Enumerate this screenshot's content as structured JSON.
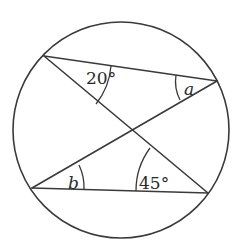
{
  "diagram": {
    "type": "circle-geometry",
    "circle": {
      "cx": 121,
      "cy": 130,
      "r": 108
    },
    "points": {
      "A": {
        "x": 44,
        "y": 56
      },
      "B": {
        "x": 217,
        "y": 81
      },
      "C": {
        "x": 32,
        "y": 188
      },
      "D": {
        "x": 208,
        "y": 193
      }
    },
    "chords": [
      {
        "from": "A",
        "to": "B"
      },
      {
        "from": "A",
        "to": "D"
      },
      {
        "from": "C",
        "to": "B"
      },
      {
        "from": "C",
        "to": "D"
      }
    ],
    "angles": [
      {
        "id": "angle-20",
        "vertex": "A",
        "label": "20°",
        "italic": false,
        "arc": "M 111 66 A 70 70 0 0 1 96 104",
        "text_x": 86,
        "text_y": 84
      },
      {
        "id": "angle-a",
        "vertex": "B",
        "label": "a",
        "italic": true,
        "arc": "M 176 75 A 41 41 0 0 0 180 100",
        "text_x": 184,
        "text_y": 95
      },
      {
        "id": "angle-b",
        "vertex": "C",
        "label": "b",
        "italic": true,
        "arc": "M 79 165 A 52 52 0 0 1 84 189",
        "text_x": 68,
        "text_y": 189
      },
      {
        "id": "angle-45",
        "vertex": "D",
        "label": "45°",
        "italic": false,
        "arc": "M 150 148 A 72 72 0 0 0 136 191",
        "text_x": 139,
        "text_y": 189
      }
    ]
  },
  "colors": {
    "stroke": "#3a3a3a",
    "text": "#2a2a2a",
    "background": "#ffffff"
  }
}
